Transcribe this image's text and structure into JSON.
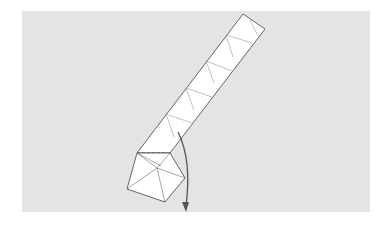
{
  "figure": {
    "background_color": "#e4e4e4",
    "paper_color": "#ffffff",
    "line_color": "#555555",
    "arrow": {
      "direction": "down",
      "label": "fold-arrow"
    },
    "strip_segments": 6
  }
}
